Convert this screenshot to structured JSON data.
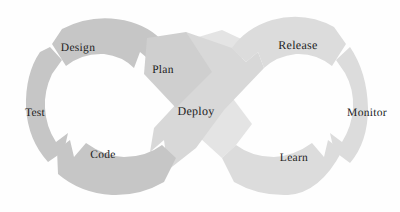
{
  "diagram": {
    "type": "infinity-loop",
    "background_color": "#fefefe",
    "gap_color": "#ffffff",
    "label_color": "#1c1c1c",
    "colors": {
      "dark_gray": "#c6c6c6",
      "mid_gray": "#cfcfcf",
      "light_gray": "#dcdcdc",
      "pale_gray": "#e4e4e4",
      "band_gray": "#d8d8d8"
    },
    "left_loop": {
      "name": "development-loop",
      "center_x": 118,
      "center_y": 106
    },
    "right_loop": {
      "name": "operations-loop",
      "center_x": 282,
      "center_y": 106
    },
    "segments": [
      {
        "id": "design",
        "label": "Design",
        "loop": "left",
        "fill": "#c6c6c6",
        "label_x": 78,
        "label_y": 48,
        "path": "M 52 44 L 62 29 Q 95 12 131 22 Q 155 29 168 48 L 152 62 L 140 52 L 134 68 Q 122 56 104 54 Q 82 53 66 66 Z"
      },
      {
        "id": "test",
        "label": "Test",
        "loop": "left",
        "fill": "#c6c6c6",
        "label_x": 35,
        "label_y": 113,
        "path": "M 50 47 L 62 60 L 52 74 Q 44 91 45 108 Q 46 127 56 142 L 68 133 L 64 151 L 48 162 Q 28 140 26 108 Q 25 74 40 52 Z"
      },
      {
        "id": "code",
        "label": "Code",
        "loop": "left",
        "fill": "#c6c6c6",
        "label_x": 103,
        "label_y": 155,
        "path": "M 57 150 L 70 140 L 74 157 L 86 143 Q 104 156 124 157 Q 146 157 162 145 L 176 158 L 164 182 Q 140 196 112 195 Q 80 193 58 174 Z"
      },
      {
        "id": "plan",
        "label": "Plan",
        "loop": "center",
        "fill": "#cfcfcf",
        "label_x": 163,
        "label_y": 70,
        "path": "M 147 38 L 186 32 L 212 72 L 176 108 L 144 74 Z"
      },
      {
        "id": "release",
        "label": "Release",
        "loop": "right",
        "fill": "#dcdcdc",
        "label_x": 298,
        "label_y": 45,
        "path": "M 232 48 Q 246 28 272 20 Q 305 11 334 27 L 346 44 L 332 66 Q 316 53 296 54 Q 277 56 264 68 L 258 52 L 246 62 Z"
      },
      {
        "id": "monitor",
        "label": "Monitor",
        "loop": "right",
        "fill": "#dcdcdc",
        "label_x": 367,
        "label_y": 113,
        "path": "M 350 47 Q 367 72 368 108 Q 368 142 350 163 L 334 151 L 330 133 L 342 142 Q 352 126 353 108 Q 354 89 345 73 L 336 60 Z"
      },
      {
        "id": "learn",
        "label": "Learn",
        "loop": "right",
        "fill": "#dcdcdc",
        "label_x": 294,
        "label_y": 158,
        "path": "M 222 158 L 236 145 Q 252 157 274 157 Q 294 156 312 143 L 324 157 L 328 140 L 342 151 Q 320 193 288 195 Q 258 196 234 182 Z"
      },
      {
        "id": "deploy-band-a",
        "label": "",
        "loop": "center",
        "fill": "#d8d8d8",
        "path": "M 186 32 L 232 48 L 246 62 L 258 52 L 264 68 L 224 110 L 196 148 L 168 170 L 164 140 L 150 152 L 154 128 L 180 100 Z"
      },
      {
        "id": "deploy-band-b",
        "label": "",
        "loop": "center",
        "fill": "#e4e4e4",
        "path": "M 222 30 L 252 44 L 222 84 L 252 124 L 236 145 L 222 158 L 200 138 L 176 108 L 150 74 L 168 46 Z"
      }
    ],
    "deploy": {
      "id": "deploy",
      "label": "Deploy",
      "label_x": 196,
      "label_y": 111
    }
  }
}
